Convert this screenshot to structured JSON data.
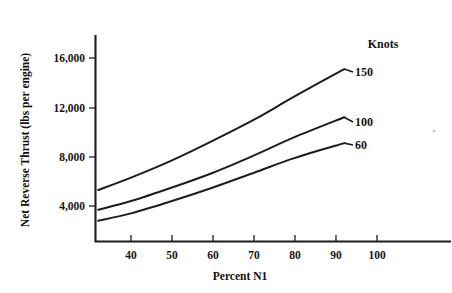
{
  "chart_data": {
    "type": "line",
    "title": "",
    "xlabel": "Percent N1",
    "ylabel": "Net Reverse Thrust (lbs per engine)",
    "legend_title": "Knots",
    "legend_position": "right-inline-labels",
    "grid": false,
    "xlim": [
      31,
      108
    ],
    "ylim": [
      1500,
      18000
    ],
    "xticks": [
      40,
      50,
      60,
      70,
      80,
      90,
      100
    ],
    "xtick_labels": [
      "40",
      "50",
      "60",
      "70",
      "80",
      "90",
      "100"
    ],
    "yticks": [
      4000,
      8000,
      12000,
      16000
    ],
    "ytick_labels": [
      "4,000",
      "8,000",
      "12,000",
      "16,000"
    ],
    "x": [
      32,
      40,
      50,
      60,
      70,
      80,
      92
    ],
    "series": [
      {
        "name": "150",
        "label": "150",
        "values": [
          5300,
          6300,
          7700,
          9300,
          11000,
          12900,
          15100
        ]
      },
      {
        "name": "100",
        "label": "100",
        "values": [
          3700,
          4400,
          5500,
          6700,
          8100,
          9600,
          11200
        ]
      },
      {
        "name": "60",
        "label": "60",
        "values": [
          2800,
          3400,
          4400,
          5500,
          6700,
          7900,
          9100
        ]
      }
    ]
  },
  "axis": {
    "x_title": "Percent N1",
    "y_title": "Net Reverse Thrust (lbs per engine)"
  },
  "legend": {
    "title": "Knots",
    "entries": [
      "150",
      "100",
      "60"
    ]
  },
  "ticks": {
    "y": [
      "16,000",
      "12,000",
      "8,000",
      "4,000"
    ],
    "x": [
      "40",
      "50",
      "60",
      "70",
      "80",
      "90",
      "100"
    ]
  }
}
